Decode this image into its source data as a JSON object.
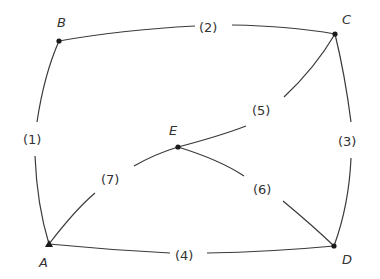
{
  "diagram": {
    "type": "graph",
    "colors": {
      "stroke": "#3a3a3a",
      "node": "#1a1a1a",
      "text": "#333333",
      "background": "#ffffff"
    },
    "nodes": {
      "A": {
        "label": "A",
        "marker": "triangle"
      },
      "B": {
        "label": "B",
        "marker": "dot"
      },
      "C": {
        "label": "C",
        "marker": "dot"
      },
      "D": {
        "label": "D",
        "marker": "dot"
      },
      "E": {
        "label": "E",
        "marker": "dot"
      }
    },
    "edges": {
      "e1": {
        "label": "(1)",
        "from": "A",
        "to": "B"
      },
      "e2": {
        "label": "(2)",
        "from": "B",
        "to": "C"
      },
      "e3": {
        "label": "(3)",
        "from": "C",
        "to": "D"
      },
      "e4": {
        "label": "(4)",
        "from": "A",
        "to": "D"
      },
      "e5": {
        "label": "(5)",
        "from": "E",
        "to": "C"
      },
      "e6": {
        "label": "(6)",
        "from": "E",
        "to": "D"
      },
      "e7": {
        "label": "(7)",
        "from": "A",
        "to": "E"
      }
    }
  }
}
